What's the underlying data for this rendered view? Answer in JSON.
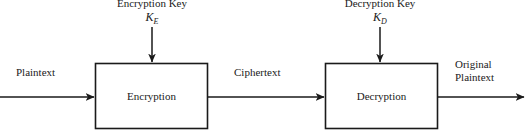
{
  "diagram": {
    "canvas": {
      "width": 529,
      "height": 136,
      "background": "#ffffff"
    },
    "stroke_color": "#1a1a1a",
    "text_color": "#1a1a1a",
    "nodes": [
      {
        "id": "encryption",
        "label": "Encryption",
        "shape": "rectangle",
        "x": 95,
        "y": 63,
        "width": 113,
        "height": 66
      },
      {
        "id": "decryption",
        "label": "Decryption",
        "shape": "rectangle",
        "x": 325,
        "y": 63,
        "width": 113,
        "height": 66
      }
    ],
    "keys": [
      {
        "id": "encryption-key",
        "label": "Encryption Key",
        "symbol_base": "K",
        "symbol_subscript": "E",
        "arrow_x": 152,
        "arrow_from_y": 27,
        "arrow_to_y": 63
      },
      {
        "id": "decryption-key",
        "label": "Decryption Key",
        "symbol_base": "K",
        "symbol_subscript": "D",
        "arrow_x": 380,
        "arrow_from_y": 27,
        "arrow_to_y": 63
      }
    ],
    "edges": [
      {
        "id": "plaintext-in",
        "label": "Plaintext",
        "from": "input",
        "to": "encryption",
        "x1": 0,
        "x2": 95,
        "y": 97
      },
      {
        "id": "ciphertext",
        "label": "Ciphertext",
        "from": "encryption",
        "to": "decryption",
        "x1": 208,
        "x2": 325,
        "y": 97
      },
      {
        "id": "plaintext-out",
        "label_line1": "Original",
        "label_line2": "Plaintext",
        "from": "decryption",
        "to": "output",
        "x1": 438,
        "x2": 524,
        "y": 97
      }
    ]
  }
}
